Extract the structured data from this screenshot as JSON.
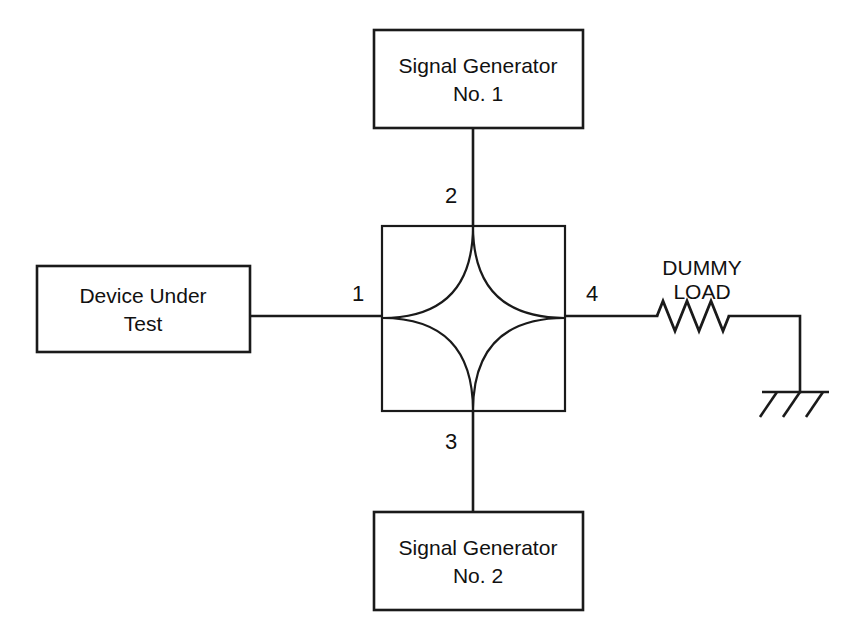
{
  "diagram": {
    "background_color": "#ffffff",
    "line_color": "#1a1a1a",
    "blocks": {
      "signal_generator_1": {
        "line1": "Signal Generator",
        "line2": "No. 1"
      },
      "signal_generator_2": {
        "line1": "Signal Generator",
        "line2": "No. 2"
      },
      "device_under_test": {
        "line1": "Device Under",
        "line2": "Test"
      },
      "dummy_load": {
        "line1": "DUMMY",
        "line2": "LOAD"
      }
    },
    "coupler": {
      "name": "hybrid-coupler",
      "shape": "square-with-four-concave-arcs",
      "ports": [
        {
          "number": "1",
          "side": "left",
          "connects_to": "device_under_test"
        },
        {
          "number": "2",
          "side": "top",
          "connects_to": "signal_generator_1"
        },
        {
          "number": "3",
          "side": "bottom",
          "connects_to": "signal_generator_2"
        },
        {
          "number": "4",
          "side": "right",
          "connects_to": "dummy_load"
        }
      ]
    },
    "symbols": {
      "resistor": "resistor-zigzag",
      "ground": "chassis-ground"
    }
  }
}
